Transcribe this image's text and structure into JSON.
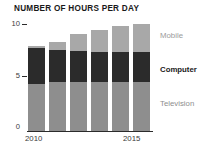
{
  "chart_data": {
    "type": "bar",
    "title": "NUMBER OF HOURS PER DAY",
    "subtitle": "",
    "xlabel": "",
    "ylabel": "",
    "stacked": true,
    "grid": false,
    "legend_position": "right",
    "categories": [
      "2010",
      "2011",
      "2012",
      "2013",
      "2014",
      "2015"
    ],
    "x_tick_labels_shown": [
      "2010",
      "2015"
    ],
    "y_tick_labels": [
      "10",
      "5",
      "0"
    ],
    "y_ticks": [
      10,
      5,
      0
    ],
    "ylim": [
      0,
      10.4
    ],
    "series": [
      {
        "name": "Television",
        "color": "#8e8e8e",
        "values": [
          4.5,
          4.6,
          4.6,
          4.6,
          4.6,
          4.6
        ]
      },
      {
        "name": "Computer",
        "color": "#2b2b2b",
        "values": [
          3.3,
          3.0,
          2.9,
          2.8,
          2.8,
          2.8
        ]
      },
      {
        "name": "Mobile",
        "color": "#a8a8a8",
        "values": [
          0.2,
          0.8,
          1.6,
          2.1,
          2.4,
          2.6
        ]
      }
    ],
    "totals": [
      8.0,
      8.4,
      9.1,
      9.5,
      9.8,
      10.0
    ]
  },
  "legend": {
    "mobile": "Mobile",
    "computer": "Computer",
    "television": "Television"
  },
  "colors": {
    "mobile": "#a8a8a8",
    "computer": "#2b2b2b",
    "television": "#8e8e8e",
    "axis": "#2b2b2b",
    "title": "#1a1a1a",
    "background": "#ffffff"
  }
}
